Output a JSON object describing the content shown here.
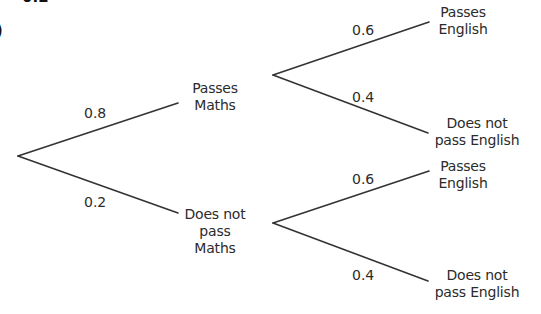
{
  "diagram": {
    "type": "probability-tree",
    "cropped_fragments": {
      "top_text": "0.2",
      "left_paren": ")"
    },
    "stage1": {
      "nodes": [
        {
          "id": "pm",
          "label_lines": [
            "Passes",
            "Maths"
          ],
          "probability": "0.8"
        },
        {
          "id": "npm",
          "label_lines": [
            "Does not",
            "pass",
            "Maths"
          ],
          "probability": "0.2"
        }
      ]
    },
    "stage2": {
      "after_passes_maths": [
        {
          "label_lines": [
            "Passes",
            "English"
          ],
          "probability": "0.6"
        },
        {
          "label_lines": [
            "Does not",
            "pass English"
          ],
          "probability": "0.4"
        }
      ],
      "after_not_passes_maths": [
        {
          "label_lines": [
            "Passes",
            "English"
          ],
          "probability": "0.6"
        },
        {
          "label_lines": [
            "Does not",
            "pass English"
          ],
          "probability": "0.4"
        }
      ]
    },
    "line_color": "#333333"
  }
}
